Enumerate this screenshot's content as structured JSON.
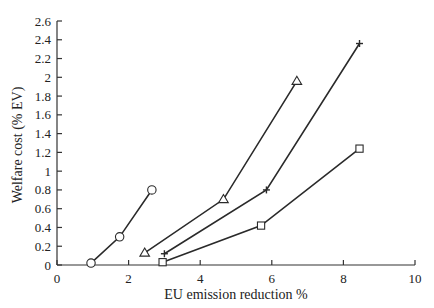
{
  "chart_data": {
    "type": "line",
    "title": "",
    "xlabel": "EU emission reduction %",
    "ylabel": "Welfare cost (% EV)",
    "xlim": [
      0,
      10
    ],
    "ylim": [
      0,
      2.6
    ],
    "x_ticks": [
      0,
      2,
      4,
      6,
      8,
      10
    ],
    "x_tick_labels": [
      "0",
      "2",
      "4",
      "6",
      "8",
      "10"
    ],
    "y_ticks": [
      0,
      0.2,
      0.4,
      0.6,
      0.8,
      1,
      1.2,
      1.4,
      1.6,
      1.8,
      2,
      2.2,
      2.4,
      2.6
    ],
    "y_tick_labels": [
      "0",
      "0.2",
      "0.4",
      "0.6",
      "0.8",
      "1",
      "1.2",
      "1.4",
      "1.6",
      "1.8",
      "2",
      "2.2",
      "2.4",
      "2.6"
    ],
    "grid": false,
    "legend": null,
    "series": [
      {
        "name": "circle",
        "marker": "circle",
        "x": [
          0.95,
          1.75,
          2.65
        ],
        "y": [
          0.02,
          0.3,
          0.8
        ]
      },
      {
        "name": "triangle",
        "marker": "triangle",
        "x": [
          2.45,
          4.65,
          6.7
        ],
        "y": [
          0.13,
          0.7,
          1.96
        ]
      },
      {
        "name": "plus",
        "marker": "plus",
        "x": [
          3.0,
          5.85,
          8.45
        ],
        "y": [
          0.12,
          0.8,
          2.36
        ]
      },
      {
        "name": "square",
        "marker": "square",
        "x": [
          2.95,
          5.7,
          8.45
        ],
        "y": [
          0.03,
          0.42,
          1.24
        ]
      }
    ]
  },
  "colors": {
    "line": "#2a2a2a",
    "axis": "#333333",
    "background": "#ffffff"
  }
}
